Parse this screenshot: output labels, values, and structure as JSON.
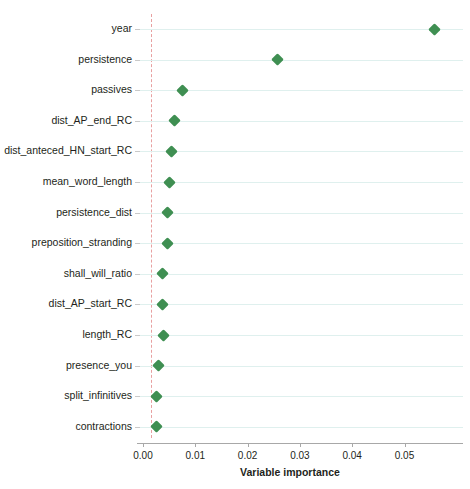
{
  "chart_data": {
    "type": "scatter",
    "title": "",
    "xlabel": "Variable importance",
    "ylabel": "",
    "xlim": [
      -0.0015,
      0.0615
    ],
    "xticks": [
      0.0,
      0.01,
      0.02,
      0.03,
      0.04,
      0.05
    ],
    "xtick_labels": [
      "0.00",
      "0.01",
      "0.02",
      "0.03",
      "0.04",
      "0.05"
    ],
    "grid": true,
    "legend": false,
    "reference_line": {
      "value": 0.0015,
      "style": "dashed",
      "color": "#e8a0a0"
    },
    "marker": {
      "shape": "diamond",
      "color": "#3f8f52"
    },
    "categories": [
      "year",
      "persistence",
      "passives",
      "dist_AP_end_RC",
      "dist_anteced_HN_start_RC",
      "mean_word_length",
      "persistence_dist",
      "preposition_stranding",
      "shall_will_ratio",
      "dist_AP_start_RC",
      "length_RC",
      "presence_you",
      "split_infinitives",
      "contractions"
    ],
    "values": [
      0.0557,
      0.0258,
      0.0076,
      0.0061,
      0.0055,
      0.005,
      0.0046,
      0.0046,
      0.0038,
      0.0038,
      0.004,
      0.0029,
      0.0025,
      0.0025
    ]
  }
}
